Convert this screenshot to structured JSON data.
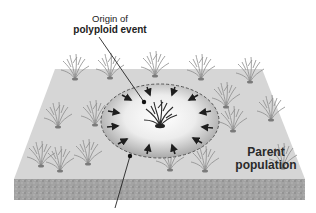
{
  "diagram": {
    "type": "illustration",
    "labels": {
      "origin": {
        "line1": "Origin of",
        "line2": "polyploid event"
      },
      "parent": {
        "line1": "Parent",
        "line2": "population"
      }
    },
    "elements": {
      "ground_block": "3D soil slab with textured side",
      "plants": "grass-like plant clumps scattered across surface",
      "polyploid_zone": "dashed ellipse with central plant and inward-pointing arrows",
      "arrow_count": 14,
      "pointer_lines": 2
    },
    "colors": {
      "surface": "#d9d9d9",
      "soil_side": "#9a9a9a",
      "plant": "#8a8a8a",
      "central_plant": "#2a2a2a",
      "zone_edge": "#555555",
      "arrow": "#1e1e1e"
    }
  }
}
